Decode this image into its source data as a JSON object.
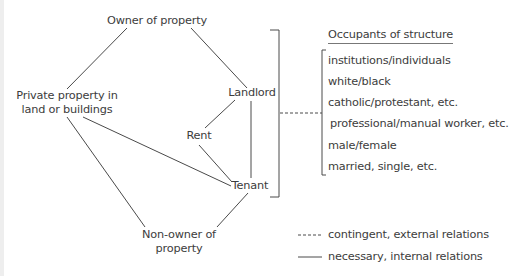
{
  "diagram": {
    "nodes": {
      "owner": "Owner of property",
      "private_property_line1": "Private property in",
      "private_property_line2": "land or buildings",
      "landlord": "Landlord",
      "rent": "Rent",
      "tenant": "Tenant",
      "non_owner_line1": "Non-owner of",
      "non_owner_line2": "property"
    },
    "occupants": {
      "header": "Occupants of structure",
      "items": [
        "institutions/individuals",
        "white/black",
        "catholic/protestant, etc.",
        "professional/manual worker, etc.",
        "male/female",
        "married, single, etc."
      ]
    },
    "legend": {
      "dashed": "contingent, external relations",
      "solid": "necessary, internal relations"
    },
    "colors": {
      "line": "#4a4a4a",
      "text": "#3c3c3c",
      "background": "#ffffff"
    }
  }
}
